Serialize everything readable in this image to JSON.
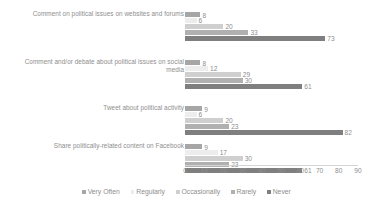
{
  "chart_data": {
    "type": "bar",
    "orientation": "horizontal",
    "title": "",
    "xlabel": "",
    "ylabel": "",
    "xlim": [
      0,
      90
    ],
    "xticks": [
      0,
      10,
      20,
      30,
      40,
      50,
      60,
      70,
      80,
      90
    ],
    "grid": false,
    "legend_position": "bottom",
    "categories": [
      "Comment on political issues on websites and forums",
      "Comment and/or debate about political issues on social media",
      "Tweet about political activity",
      "Share politically-related content on Facebook"
    ],
    "series": [
      {
        "name": "Very Often",
        "color": "#a6a6a6",
        "values": [
          8,
          8,
          9,
          9
        ]
      },
      {
        "name": "Regularly",
        "color": "#ededed",
        "values": [
          6,
          12,
          6,
          17
        ]
      },
      {
        "name": "Occasionally",
        "color": "#cfcfcf",
        "values": [
          20,
          29,
          20,
          30
        ]
      },
      {
        "name": "Rarely",
        "color": "#b0b0b0",
        "values": [
          33,
          30,
          23,
          23
        ]
      },
      {
        "name": "Never",
        "color": "#7f7f7f",
        "values": [
          73,
          61,
          82,
          61
        ]
      }
    ]
  }
}
